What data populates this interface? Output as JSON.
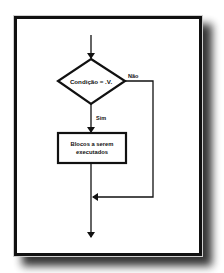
{
  "diagram": {
    "type": "flowchart",
    "title": "",
    "nodes": [
      {
        "id": "cond",
        "shape": "diamond",
        "label": "Condição = .V."
      },
      {
        "id": "block",
        "shape": "rectangle",
        "label_line1": "Blocos a serem",
        "label_line2": "executados"
      }
    ],
    "edges": [
      {
        "from": "start",
        "to": "cond",
        "label": ""
      },
      {
        "from": "cond",
        "to": "block",
        "label": "Sim"
      },
      {
        "from": "cond",
        "to": "merge",
        "label": "Não"
      },
      {
        "from": "block",
        "to": "merge",
        "label": ""
      },
      {
        "from": "merge",
        "to": "end",
        "label": ""
      }
    ],
    "colors": {
      "stroke": "#111111",
      "background": "#ffffff",
      "frame": "#111111"
    }
  }
}
